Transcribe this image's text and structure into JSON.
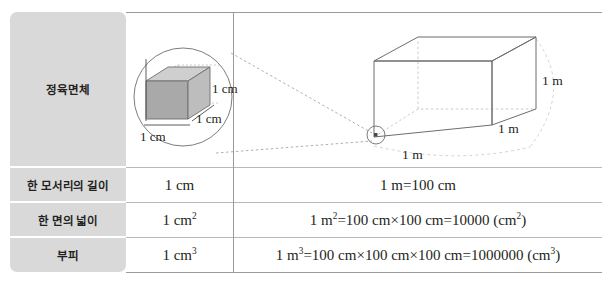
{
  "table": {
    "row_labels": [
      "정육면체",
      "한 모서리의 길이",
      "한 면의 넓이",
      "부피"
    ],
    "rows": [
      {
        "label": "한 모서리의 길이",
        "cm_value": "1 cm",
        "m_value_html": "1 m=100 cm"
      },
      {
        "label": "한 면의 넓이",
        "cm_value": "1 cm2",
        "m_value_html": "1 m2=100 cm×100 cm=10000 (cm2)"
      },
      {
        "label": "부피",
        "cm_value": "1 cm3",
        "m_value_html": "1 m3=100 cm×100 cm×100 cm=1000000 (cm3)"
      }
    ]
  },
  "figure": {
    "small_cube": {
      "labels": [
        "1 cm",
        "1 cm",
        "1 cm"
      ],
      "face_colors": {
        "top": "#cfcfcf",
        "left": "#a9a9a9",
        "front": "#bdbdbd"
      }
    },
    "large_cube": {
      "labels": [
        "1 m",
        "1 m",
        "1 m"
      ]
    },
    "magnifier": {
      "circle_label": "magnified-corner",
      "connector_style": "dashed"
    }
  },
  "colors": {
    "label_cell_bg": "#d9d9d9",
    "text": "#231f20",
    "rule": "#b9b9b9",
    "rule_strong": "#9a9a9a",
    "page_bg": "#ffffff"
  }
}
